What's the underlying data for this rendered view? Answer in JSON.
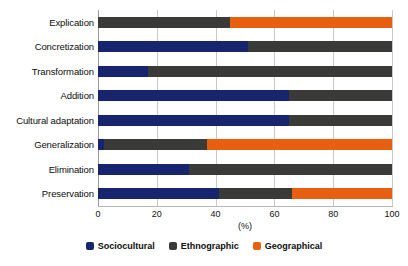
{
  "chart_data": {
    "type": "bar",
    "orientation": "horizontal",
    "stacked": true,
    "normalized": true,
    "title": "",
    "subtitle": "",
    "xlabel": "(%)",
    "ylabel": "",
    "xlim": [
      0,
      100
    ],
    "xticks": [
      0,
      20,
      40,
      60,
      80,
      100
    ],
    "xtick_labels": [
      "0",
      "20",
      "40",
      "60",
      "80",
      "100"
    ],
    "grid": "vertical",
    "legend_position": "bottom-center",
    "categories": [
      "Explication",
      "Concretization",
      "Transformation",
      "Addition",
      "Cultural adaptation",
      "Generalization",
      "Elimination",
      "Preservation"
    ],
    "series": [
      {
        "name": "Sociocultural",
        "color": "#16256e",
        "values": [
          0,
          51,
          17,
          65,
          65,
          2,
          31,
          41
        ]
      },
      {
        "name": "Ethnographic",
        "color": "#3a3a38",
        "values": [
          45,
          49,
          83,
          35,
          35,
          35,
          69,
          25
        ]
      },
      {
        "name": "Geographical",
        "color": "#e8600f",
        "values": [
          55,
          0,
          0,
          0,
          0,
          63,
          0,
          34
        ]
      }
    ],
    "legend": [
      {
        "label": "Sociocultural",
        "color": "#16256e"
      },
      {
        "label": "Ethnographic",
        "color": "#3a3a38"
      },
      {
        "label": "Geographical",
        "color": "#e8600f"
      }
    ],
    "colors": {
      "sociocultural": "#16256e",
      "ethnographic": "#3a3a38",
      "geographical": "#e8600f",
      "gridline": "#c9c9c9",
      "axis": "#9a9a9a",
      "background": "#ffffff",
      "text": "#0d0d0d"
    }
  }
}
